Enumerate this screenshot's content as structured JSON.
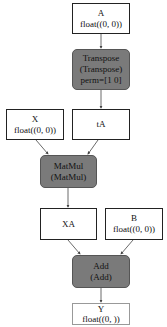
{
  "nodes": {
    "A": {
      "name": "A",
      "type": "float((0, 0))"
    },
    "transpose": {
      "line1": "Transpose",
      "line2": "(Transpose)",
      "line3": "perm=[1 0]"
    },
    "X": {
      "name": "X",
      "type": "float((0, 0))"
    },
    "tA": {
      "name": "tA"
    },
    "matmul": {
      "line1": "MatMul",
      "line2": "(MatMul)"
    },
    "XA": {
      "name": "XA"
    },
    "B": {
      "name": "B",
      "type": "float((0, 0))"
    },
    "add": {
      "line1": "Add",
      "line2": "(Add)"
    },
    "Y": {
      "name": "Y",
      "type": "float((0, ))"
    }
  },
  "colors": {
    "op_fill": "#7a7a7a",
    "border": "#222222",
    "edge": "#444444"
  }
}
